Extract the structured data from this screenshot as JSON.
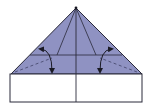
{
  "diagram": {
    "type": "origami-fold-step",
    "colors": {
      "paper_colored": "#8f92c2",
      "paper_white": "#ffffff",
      "line": "#2a2a3a",
      "dashed": "#4a4c70"
    },
    "shapes": {
      "triangle": {
        "apex": [
          76,
          8
        ],
        "base_left": [
          11,
          74
        ],
        "base_right": [
          142,
          74
        ]
      },
      "rectangle": {
        "x": 10,
        "y": 74,
        "width": 132,
        "height": 28
      },
      "center_line_x": 76,
      "horizontal_fold_y": 55,
      "inner_lines": [
        [
          57,
          55
        ],
        [
          96,
          55
        ]
      ],
      "valley_folds": [
        {
          "from": [
            14,
            72
          ],
          "to": [
            52,
            57
          ]
        },
        {
          "from": [
            138,
            72
          ],
          "to": [
            100,
            57
          ]
        }
      ]
    },
    "arrows": [
      {
        "side": "left",
        "path": "M41 49 Q52 50 52 71"
      },
      {
        "side": "right",
        "path": "M111 49 Q100 50 100 71"
      }
    ]
  }
}
